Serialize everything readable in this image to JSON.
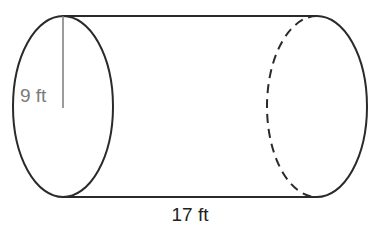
{
  "diagram": {
    "type": "cylinder",
    "radius_label": "9 ft",
    "length_label": "17 ft",
    "colors": {
      "outline": "#2a2a2a",
      "radius_label": "#7a7a7a",
      "length_label": "#222222",
      "background": "#ffffff"
    }
  }
}
